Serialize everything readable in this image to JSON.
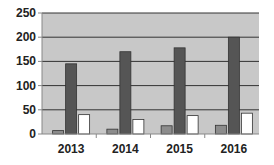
{
  "chart_data": {
    "type": "bar",
    "title": "",
    "xlabel": "",
    "ylabel": "",
    "categories": [
      "2013",
      "2014",
      "2015",
      "2016"
    ],
    "series": [
      {
        "name": "Series 1",
        "color": "#8c8c8c",
        "values": [
          7,
          10,
          17,
          18
        ]
      },
      {
        "name": "Series 2",
        "color": "#555555",
        "values": [
          145,
          170,
          178,
          200
        ]
      },
      {
        "name": "Series 3",
        "color": "#ffffff",
        "values": [
          40,
          30,
          38,
          43
        ]
      }
    ],
    "ylim": [
      0,
      250
    ],
    "yticks": [
      0,
      50,
      100,
      150,
      200,
      250
    ],
    "grid": true,
    "legend": "none",
    "plot_background": "#c8c8c8"
  }
}
